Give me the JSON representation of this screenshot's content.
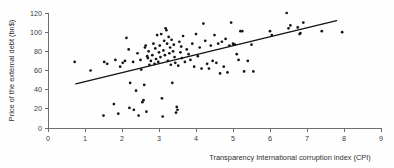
{
  "chart_data": {
    "type": "scatter",
    "title": "",
    "xlabel": "Transparency International corruption index (CPI)",
    "ylabel": "Price of the external debt (bn$)",
    "xlim": [
      0,
      9
    ],
    "ylim": [
      0,
      120
    ],
    "xticks": [
      0,
      1,
      2,
      3,
      4,
      5,
      6,
      7,
      8,
      9
    ],
    "yticks": [
      0,
      20,
      40,
      60,
      80,
      100,
      120
    ],
    "xtick_labels": [
      "0",
      "1",
      "2",
      "3",
      "4",
      "5",
      "6",
      "7",
      "8",
      "9"
    ],
    "ytick_labels": [
      "0",
      "20",
      "40",
      "60",
      "80",
      "100",
      "120"
    ],
    "grid": false,
    "legend": null,
    "marker": "filled-circle",
    "marker_color": "#141414",
    "trendline": {
      "type": "linear-fit",
      "color": "#111111",
      "x_start": 0.75,
      "y_start": 46,
      "x_end": 7.8,
      "y_end": 112
    },
    "points": [
      [
        0.72,
        69
      ],
      [
        1.15,
        60
      ],
      [
        1.5,
        13
      ],
      [
        1.52,
        69
      ],
      [
        1.6,
        67
      ],
      [
        1.78,
        25
      ],
      [
        1.82,
        71
      ],
      [
        1.9,
        15
      ],
      [
        1.95,
        64
      ],
      [
        2.02,
        68
      ],
      [
        2.08,
        70
      ],
      [
        2.12,
        94
      ],
      [
        2.18,
        82
      ],
      [
        2.2,
        21
      ],
      [
        2.22,
        47
      ],
      [
        2.3,
        69
      ],
      [
        2.32,
        19
      ],
      [
        2.38,
        39
      ],
      [
        2.42,
        78
      ],
      [
        2.45,
        13
      ],
      [
        2.5,
        71
      ],
      [
        2.52,
        61
      ],
      [
        2.55,
        27
      ],
      [
        2.58,
        29
      ],
      [
        2.6,
        45
      ],
      [
        2.62,
        84
      ],
      [
        2.64,
        86
      ],
      [
        2.66,
        17
      ],
      [
        2.68,
        75
      ],
      [
        2.7,
        73
      ],
      [
        2.72,
        80
      ],
      [
        2.74,
        66
      ],
      [
        2.78,
        70
      ],
      [
        2.82,
        76
      ],
      [
        2.85,
        88
      ],
      [
        2.88,
        67
      ],
      [
        2.9,
        83
      ],
      [
        2.92,
        72
      ],
      [
        2.95,
        97
      ],
      [
        2.98,
        69
      ],
      [
        3.0,
        79
      ],
      [
        3.02,
        86
      ],
      [
        3.04,
        74
      ],
      [
        3.06,
        98
      ],
      [
        3.08,
        31
      ],
      [
        3.1,
        12
      ],
      [
        3.12,
        81
      ],
      [
        3.14,
        91
      ],
      [
        3.16,
        76
      ],
      [
        3.18,
        104
      ],
      [
        3.2,
        102
      ],
      [
        3.22,
        88
      ],
      [
        3.24,
        70
      ],
      [
        3.26,
        95
      ],
      [
        3.28,
        78
      ],
      [
        3.3,
        84
      ],
      [
        3.32,
        66
      ],
      [
        3.34,
        92
      ],
      [
        3.36,
        47
      ],
      [
        3.38,
        80
      ],
      [
        3.4,
        87
      ],
      [
        3.42,
        74
      ],
      [
        3.44,
        68
      ],
      [
        3.46,
        16
      ],
      [
        3.48,
        22
      ],
      [
        3.5,
        19
      ],
      [
        3.52,
        65
      ],
      [
        3.55,
        90
      ],
      [
        3.58,
        79
      ],
      [
        3.6,
        85
      ],
      [
        3.62,
        73
      ],
      [
        3.65,
        96
      ],
      [
        3.7,
        69
      ],
      [
        3.75,
        82
      ],
      [
        3.8,
        77
      ],
      [
        3.85,
        71
      ],
      [
        3.9,
        88
      ],
      [
        3.95,
        64
      ],
      [
        4.0,
        98
      ],
      [
        4.05,
        75
      ],
      [
        4.1,
        84
      ],
      [
        4.15,
        62
      ],
      [
        4.2,
        109
      ],
      [
        4.25,
        91
      ],
      [
        4.3,
        67
      ],
      [
        4.35,
        62
      ],
      [
        4.4,
        86
      ],
      [
        4.45,
        70
      ],
      [
        4.5,
        97
      ],
      [
        4.55,
        68
      ],
      [
        4.6,
        88
      ],
      [
        4.65,
        57
      ],
      [
        4.7,
        90
      ],
      [
        4.75,
        64
      ],
      [
        4.8,
        93
      ],
      [
        4.85,
        58
      ],
      [
        4.9,
        86
      ],
      [
        4.95,
        110
      ],
      [
        5.0,
        88
      ],
      [
        5.02,
        87
      ],
      [
        5.05,
        87
      ],
      [
        5.1,
        77
      ],
      [
        5.15,
        71
      ],
      [
        5.2,
        101
      ],
      [
        5.25,
        101
      ],
      [
        5.3,
        59
      ],
      [
        5.4,
        70
      ],
      [
        5.5,
        87
      ],
      [
        5.55,
        59
      ],
      [
        6.0,
        101
      ],
      [
        6.05,
        97
      ],
      [
        6.45,
        120
      ],
      [
        6.5,
        104
      ],
      [
        6.55,
        107
      ],
      [
        6.75,
        105
      ],
      [
        6.8,
        98
      ],
      [
        6.82,
        99
      ],
      [
        6.9,
        110
      ],
      [
        7.4,
        101
      ],
      [
        7.95,
        100
      ]
    ]
  }
}
